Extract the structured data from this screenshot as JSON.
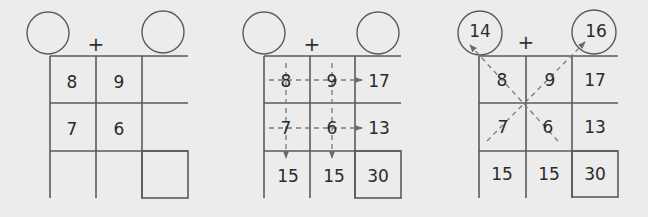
{
  "operator": "+",
  "panels": [
    {
      "name": "step-1-given",
      "circles": {
        "left": "",
        "right": ""
      },
      "grid": [
        [
          "8",
          "9",
          ""
        ],
        [
          "7",
          "6",
          ""
        ],
        [
          "",
          "",
          ""
        ]
      ]
    },
    {
      "name": "step-2-row-column-sums",
      "circles": {
        "left": "",
        "right": ""
      },
      "grid": [
        [
          "8",
          "9",
          "17"
        ],
        [
          "7",
          "6",
          "13"
        ],
        [
          "15",
          "15",
          "30"
        ]
      ]
    },
    {
      "name": "step-3-diagonal-sums",
      "circles": {
        "left": "14",
        "right": "16"
      },
      "grid": [
        [
          "8",
          "9",
          "17"
        ],
        [
          "7",
          "6",
          "13"
        ],
        [
          "15",
          "15",
          "30"
        ]
      ]
    }
  ],
  "colors": {
    "background": "#ececec",
    "line": "#5a5a5a",
    "dashed": "#7a7a7a",
    "text": "#2a2a2a"
  }
}
